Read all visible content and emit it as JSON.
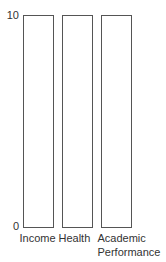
{
  "chart_data": {
    "type": "bar",
    "title": "",
    "xlabel": "",
    "ylabel": "",
    "categories": [
      {
        "lines": [
          "Income"
        ]
      },
      {
        "lines": [
          "Health"
        ]
      },
      {
        "lines": [
          "Academic",
          "Performance"
        ]
      }
    ],
    "values": [
      10,
      10,
      10
    ],
    "ylim": [
      0,
      10
    ],
    "yticks": [
      "0",
      "10"
    ],
    "grid": false,
    "legend": "none",
    "bar_fill": "#ffffff",
    "bar_stroke": "#555555"
  }
}
